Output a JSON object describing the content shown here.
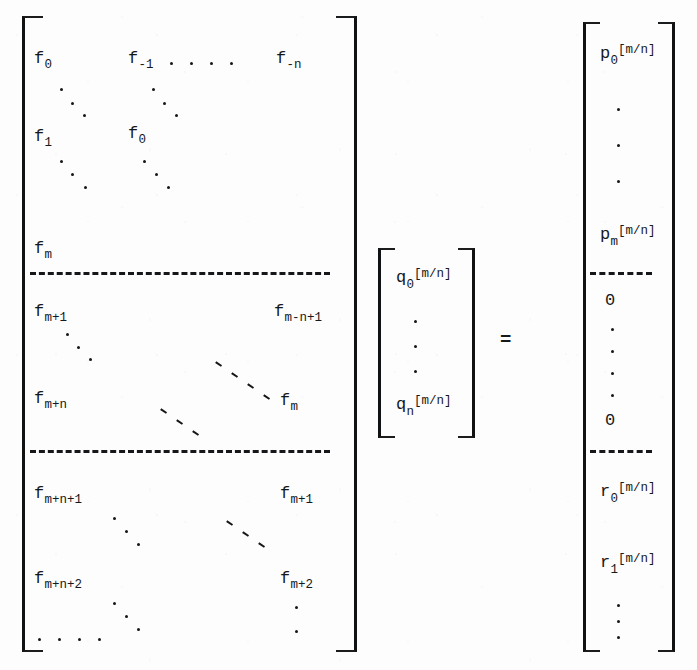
{
  "equation": {
    "description": "Linear system for Pade approximant coefficients",
    "relation": "=",
    "coefficient_matrix": {
      "open_bracket": "[",
      "close_bracket": "]",
      "blocks": [
        {
          "name": "top-block",
          "rows": [
            {
              "left": {
                "base": "f",
                "sub": "0"
              },
              "mid": {
                "base": "f",
                "sub": "-1"
              },
              "right": {
                "base": "f",
                "sub": "-n"
              }
            },
            {
              "left": {
                "base": "f",
                "sub": "1"
              },
              "mid": {
                "base": "f",
                "sub": "0"
              },
              "right": null
            },
            {
              "left": {
                "base": "f",
                "sub": "m"
              },
              "mid": null,
              "right": null
            }
          ]
        },
        {
          "name": "middle-block",
          "rows": [
            {
              "left": {
                "base": "f",
                "sub": "m+1"
              },
              "mid": null,
              "right": {
                "base": "f",
                "sub": "m-n+1"
              }
            },
            {
              "left": {
                "base": "f",
                "sub": "m+n"
              },
              "mid": null,
              "right": {
                "base": "f",
                "sub": "m"
              }
            }
          ]
        },
        {
          "name": "bottom-block",
          "rows": [
            {
              "left": {
                "base": "f",
                "sub": "m+n+1"
              },
              "mid": null,
              "right": {
                "base": "f",
                "sub": "m+1"
              }
            },
            {
              "left": {
                "base": "f",
                "sub": "m+n+2"
              },
              "mid": null,
              "right": {
                "base": "f",
                "sub": "m+2"
              }
            }
          ]
        }
      ]
    },
    "unknown_vector": {
      "open_bracket": "[",
      "close_bracket": "]",
      "entries": [
        {
          "base": "q",
          "sub": "0",
          "sup": "[m/n]"
        },
        {
          "base": "⋮"
        },
        {
          "base": "q",
          "sub": "n",
          "sup": "[m/n]"
        }
      ]
    },
    "right_vector": {
      "open_bracket": "[",
      "close_bracket": "]",
      "blocks": [
        {
          "name": "p-block",
          "entries": [
            {
              "base": "p",
              "sub": "0",
              "sup": "[m/n]"
            },
            {
              "base": "⋮"
            },
            {
              "base": "p",
              "sub": "m",
              "sup": "[m/n]"
            }
          ]
        },
        {
          "name": "zero-block",
          "entries": [
            {
              "base": "0"
            },
            {
              "base": "⋮"
            },
            {
              "base": "0"
            }
          ]
        },
        {
          "name": "r-block",
          "entries": [
            {
              "base": "r",
              "sub": "0",
              "sup": "[m/n]"
            },
            {
              "base": "r",
              "sub": "1",
              "sup": "[m/n]"
            },
            {
              "base": "⋮"
            }
          ]
        }
      ]
    }
  },
  "labels": {
    "f0": "f",
    "f0_sub": "0",
    "fm1": "f",
    "fm1_sub": "-1",
    "fmn": "f",
    "fmn_sub": "-n",
    "f1": "f",
    "f1_sub": "1",
    "f0b": "f",
    "f0b_sub": "0",
    "fm": "f",
    "fm_sub": "m",
    "fmp1": "f",
    "fmp1_sub": "m+1",
    "fmnp1": "f",
    "fmnp1_sub": "m-n+1",
    "fmpn": "f",
    "fmpn_sub": "m+n",
    "fm2": "f",
    "fm2_sub": "m",
    "fmnp1b": "f",
    "fmnp1b_sub": "m+n+1",
    "fmp1b": "f",
    "fmp1b_sub": "m+1",
    "fmnp2": "f",
    "fmnp2_sub": "m+n+2",
    "fmp2": "f",
    "fmp2_sub": "m+2",
    "q": "q",
    "q0_sub": "0",
    "qn_sub": "n",
    "q_sup": "[m/n]",
    "p": "p",
    "p0_sub": "0",
    "pm_sub": "m",
    "p_sup": "[m/n]",
    "r": "r",
    "r0_sub": "0",
    "r1_sub": "1",
    "r_sup": "[m/n]",
    "zero": "0",
    "equals": "="
  },
  "colors": {
    "ink": "#17181a",
    "paper": "#fdfdfd"
  }
}
